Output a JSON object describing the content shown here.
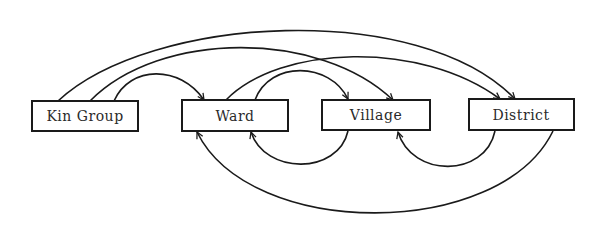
{
  "diagram": {
    "type": "directed-graph",
    "nodes": [
      {
        "id": "kin_group",
        "label": "Kin Group"
      },
      {
        "id": "ward",
        "label": "Ward"
      },
      {
        "id": "village",
        "label": "Village"
      },
      {
        "id": "district",
        "label": "District"
      }
    ],
    "edges": [
      {
        "from": "Kin Group",
        "to": "District",
        "side": "top"
      },
      {
        "from": "Kin Group",
        "to": "Village",
        "side": "top"
      },
      {
        "from": "Kin Group",
        "to": "Ward",
        "side": "top"
      },
      {
        "from": "Ward",
        "to": "District",
        "side": "top"
      },
      {
        "from": "Ward",
        "to": "Village",
        "side": "top"
      },
      {
        "from": "Village",
        "to": "Ward",
        "side": "bottom"
      },
      {
        "from": "District",
        "to": "Village",
        "side": "bottom"
      },
      {
        "from": "District",
        "to": "Ward",
        "side": "bottom"
      }
    ],
    "colors": {
      "line": "#1a1a1a",
      "background": "#ffffff",
      "text": "#2a2a2a"
    }
  }
}
